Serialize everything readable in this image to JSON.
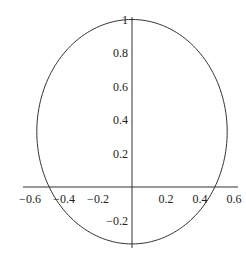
{
  "chart_data": {
    "type": "line",
    "title": "",
    "xlabel": "",
    "ylabel": "",
    "grid": false,
    "legend": null,
    "xlim": [
      -0.62,
      0.62
    ],
    "ylim": [
      -0.36,
      1.02
    ],
    "x_ticks": [
      {
        "value": -0.6,
        "label": "−0.6"
      },
      {
        "value": -0.4,
        "label": "−0.4"
      },
      {
        "value": -0.2,
        "label": "−0.2"
      },
      {
        "value": 0.2,
        "label": "0.2"
      },
      {
        "value": 0.4,
        "label": "0.4"
      },
      {
        "value": 0.6,
        "label": "0.6"
      }
    ],
    "y_ticks": [
      {
        "value": 1,
        "label": "1"
      },
      {
        "value": 0.8,
        "label": "0.8"
      },
      {
        "value": 0.6,
        "label": "0.6"
      },
      {
        "value": 0.4,
        "label": "0.4"
      },
      {
        "value": 0.2,
        "label": "0.2"
      },
      {
        "value": -0.2,
        "label": "−0.2"
      }
    ],
    "series": [
      {
        "name": "closed curve",
        "shape": "ellipse",
        "center": [
          0,
          0.33
        ],
        "rx": 0.56,
        "ry": 0.67,
        "top": 1.0,
        "bottom": -0.34,
        "x_intercepts": [
          -0.48,
          0.47
        ],
        "color": "#333333"
      }
    ]
  },
  "colors": {
    "axis": "#333333",
    "curve": "#333333",
    "text": "#222222",
    "background": "#ffffff"
  }
}
